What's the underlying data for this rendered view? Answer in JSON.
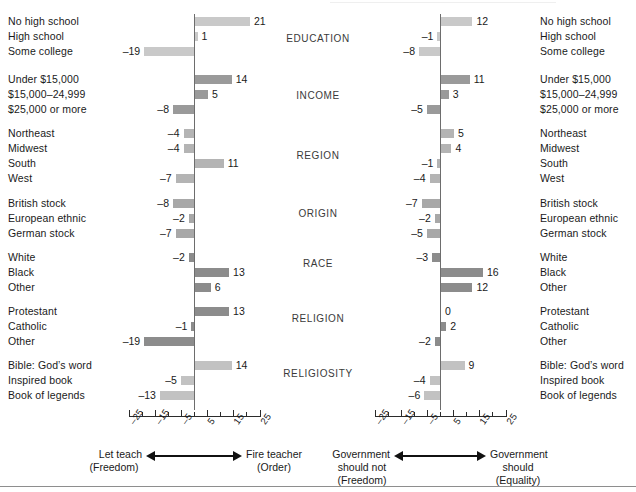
{
  "chart_data": {
    "type": "bar",
    "title": "",
    "orientation": "horizontal-diverging",
    "panels": [
      {
        "id": "left",
        "xlabel_left": "Let teach",
        "xlabel_left_sub": "(Freedom)",
        "xlabel_right": "Fire teacher",
        "xlabel_right_sub": "(Order)",
        "xlim": [
          -25,
          25
        ],
        "ticks": [
          -25,
          -15,
          -5,
          5,
          15,
          25
        ],
        "tick_labels": [
          "–25",
          "–15",
          "–5",
          "5",
          "15",
          "25"
        ],
        "grid": false,
        "groups": [
          {
            "name": "EDUCATION",
            "color": "#c9c9c9",
            "categories": [
              "No high school",
              "High school",
              "Some college"
            ],
            "values": [
              21,
              1,
              -19
            ],
            "value_labels": [
              "21",
              "1",
              "–19"
            ]
          },
          {
            "name": "INCOME",
            "color": "#9a9a9a",
            "categories": [
              "Under $15,000",
              "$15,000–24,999",
              "$25,000 or more"
            ],
            "values": [
              14,
              5,
              -8
            ],
            "value_labels": [
              "14",
              "5",
              "–8"
            ]
          },
          {
            "name": "REGION",
            "color": "#b4b4b4",
            "categories": [
              "Northeast",
              "Midwest",
              "South",
              "West"
            ],
            "values": [
              -4,
              -4,
              11,
              -7
            ],
            "value_labels": [
              "–4",
              "–4",
              "11",
              "–7"
            ]
          },
          {
            "name": "ORIGIN",
            "color": "#a8a8a8",
            "categories": [
              "British stock",
              "European ethnic",
              "German stock"
            ],
            "values": [
              -8,
              -2,
              -7
            ],
            "value_labels": [
              "–8",
              "–2",
              "–7"
            ]
          },
          {
            "name": "RACE",
            "color": "#8c8c8c",
            "categories": [
              "White",
              "Black",
              "Other"
            ],
            "values": [
              -2,
              13,
              6
            ],
            "value_labels": [
              "–2",
              "13",
              "6"
            ]
          },
          {
            "name": "RELIGION",
            "color": "#8c8c8c",
            "categories": [
              "Protestant",
              "Catholic",
              "Other"
            ],
            "values": [
              13,
              -1,
              -19
            ],
            "value_labels": [
              "13",
              "–1",
              "–19"
            ]
          },
          {
            "name": "RELIGIOSITY",
            "color": "#c2c2c2",
            "categories": [
              "Bible: God’s word",
              "Inspired book",
              "Book of legends"
            ],
            "values": [
              14,
              -5,
              -13
            ],
            "value_labels": [
              "14",
              "–5",
              "–13"
            ]
          }
        ]
      },
      {
        "id": "right",
        "xlabel_left": "Government",
        "xlabel_left_2": "should not",
        "xlabel_left_sub": "(Freedom)",
        "xlabel_right": "Government",
        "xlabel_right_2": "should",
        "xlabel_right_sub": "(Equality)",
        "xlim": [
          -25,
          25
        ],
        "ticks": [
          -25,
          -15,
          -5,
          5,
          15,
          25
        ],
        "tick_labels": [
          "–25",
          "–15",
          "–5",
          "5",
          "15",
          "25"
        ],
        "grid": false,
        "groups": [
          {
            "name": "EDUCATION",
            "color": "#c9c9c9",
            "categories": [
              "No high school",
              "High school",
              "Some college"
            ],
            "values": [
              12,
              -1,
              -8
            ],
            "value_labels": [
              "12",
              "–1",
              "–8"
            ]
          },
          {
            "name": "INCOME",
            "color": "#9a9a9a",
            "categories": [
              "Under $15,000",
              "$15,000–24,999",
              "$25,000 or more"
            ],
            "values": [
              11,
              3,
              -5
            ],
            "value_labels": [
              "11",
              "3",
              "–5"
            ]
          },
          {
            "name": "REGION",
            "color": "#b4b4b4",
            "categories": [
              "Northeast",
              "Midwest",
              "South",
              "West"
            ],
            "values": [
              5,
              4,
              -1,
              -4
            ],
            "value_labels": [
              "5",
              "4",
              "–1",
              "–4"
            ]
          },
          {
            "name": "ORIGIN",
            "color": "#a8a8a8",
            "categories": [
              "British stock",
              "European ethnic",
              "German stock"
            ],
            "values": [
              -7,
              -2,
              -5
            ],
            "value_labels": [
              "–7",
              "–2",
              "–5"
            ]
          },
          {
            "name": "RACE",
            "color": "#8c8c8c",
            "categories": [
              "White",
              "Black",
              "Other"
            ],
            "values": [
              -3,
              16,
              12
            ],
            "value_labels": [
              "–3",
              "16",
              "12"
            ]
          },
          {
            "name": "RELIGION",
            "color": "#8c8c8c",
            "categories": [
              "Protestant",
              "Catholic",
              "Other"
            ],
            "values": [
              0,
              2,
              -2
            ],
            "value_labels": [
              "0",
              "2",
              "–2"
            ]
          },
          {
            "name": "RELIGIOSITY",
            "color": "#c2c2c2",
            "categories": [
              "Bible: God’s word",
              "Inspired book",
              "Book of legends"
            ],
            "values": [
              9,
              -4,
              -6
            ],
            "value_labels": [
              "9",
              "–4",
              "–6"
            ]
          }
        ]
      }
    ]
  }
}
